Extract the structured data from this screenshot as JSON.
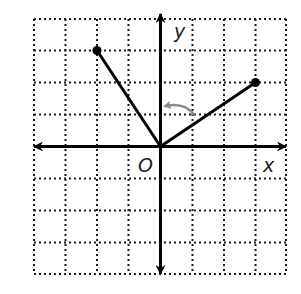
{
  "diagram": {
    "type": "coordinate-grid-rotation",
    "grid": {
      "x_min": -4,
      "x_max": 4,
      "y_min": -4,
      "y_max": 4,
      "step": 1,
      "line_style": "dotted",
      "line_color": "#1a1a1a"
    },
    "axes": {
      "x_label": "x",
      "y_label": "y",
      "origin_label": "O",
      "color": "#000000"
    },
    "segments": [
      {
        "name": "segment-to-left-point",
        "from": [
          0,
          0
        ],
        "to": [
          -2,
          3
        ]
      },
      {
        "name": "segment-to-right-point",
        "from": [
          0,
          0
        ],
        "to": [
          3,
          2
        ]
      }
    ],
    "points": [
      {
        "name": "point-left",
        "coords": [
          -2,
          3
        ]
      },
      {
        "name": "point-right",
        "coords": [
          3,
          2
        ]
      }
    ],
    "rotation_arrow": {
      "direction": "counterclockwise",
      "color": "#8a8a8a",
      "from_segment": "segment-to-right-point",
      "toward": "y-axis"
    }
  }
}
